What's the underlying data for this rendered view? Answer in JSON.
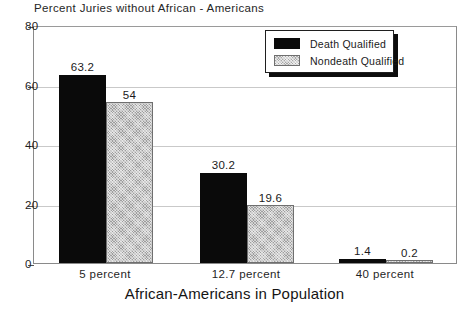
{
  "chart_data": {
    "type": "bar",
    "title": "Percent Juries without African - Americans",
    "xlabel": "African-Americans in Population",
    "ylabel": "",
    "categories": [
      "5 percent",
      "12.7 percent",
      "40 percent"
    ],
    "series": [
      {
        "name": "Death Qualified",
        "color": "#0a0a0a",
        "values": [
          63.2,
          30.2,
          1.4
        ],
        "labels": [
          "63.2",
          "30.2",
          "1.4"
        ]
      },
      {
        "name": "Nondeath Qualified",
        "color": "#9e9e9e",
        "values": [
          54,
          19.6,
          0.2
        ],
        "labels": [
          "54",
          "19.6",
          "0.2"
        ]
      }
    ],
    "ylim": [
      0,
      80
    ],
    "yticks": [
      0,
      20,
      40,
      60,
      80
    ],
    "ytick_labels": [
      "0",
      "20",
      "40",
      "60",
      "80"
    ],
    "grid": true,
    "legend_position": "top-right"
  },
  "legend": {
    "entries": [
      {
        "label": "Death Qualified",
        "swatch": "black-swatch"
      },
      {
        "label": "Nondeath Qualified",
        "swatch": "gray-hatched-swatch"
      }
    ]
  }
}
